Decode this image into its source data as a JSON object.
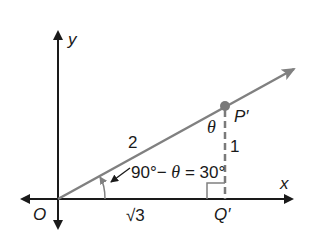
{
  "diagram": {
    "axes": {
      "x_label": "x",
      "y_label": "y",
      "origin_label": "O"
    },
    "points": {
      "P": "P′",
      "Q": "Q′"
    },
    "sides": {
      "hypotenuse": "2",
      "opposite": "1",
      "adjacent": "√3"
    },
    "angles": {
      "theta": "θ",
      "equation_part1": "90°− ",
      "equation_theta": "θ",
      "equation_part2": " = 30°"
    },
    "colors": {
      "axis": "#1a1a1a",
      "ray": "#808080",
      "point": "#7a7a7a"
    }
  }
}
